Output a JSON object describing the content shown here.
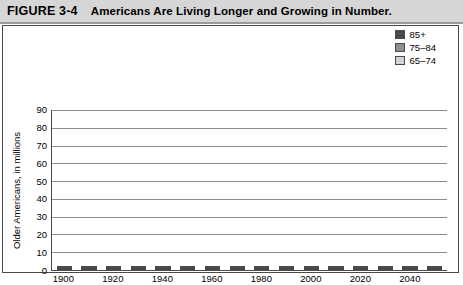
{
  "header": {
    "figure_number": "FIGURE 3-4",
    "title": "Americans Are Living Longer and Growing in Number."
  },
  "legend": {
    "position": "top-right",
    "items": [
      {
        "label": "85+",
        "color": "#494949",
        "key": "85+"
      },
      {
        "label": "75–84",
        "color": "#8f8f8f",
        "key": "75-84"
      },
      {
        "label": "65–74",
        "color": "#d2d2d2",
        "key": "65-74"
      }
    ]
  },
  "chart_data": {
    "type": "bar",
    "subtype": "stacked-vertical",
    "title": "Americans Are Living Longer and Growing in Number.",
    "xlabel": "",
    "ylabel": "Older Americans, in millions",
    "ylim": [
      0,
      90
    ],
    "ytick_step": 10,
    "yticks": [
      0,
      10,
      20,
      30,
      40,
      50,
      60,
      70,
      80,
      90
    ],
    "grid": "horizontal",
    "categories": [
      "1900",
      "1910",
      "1920",
      "1930",
      "1940",
      "1950",
      "1960",
      "1970",
      "1980",
      "1990",
      "2000",
      "2010",
      "2020",
      "2030",
      "2040",
      "2050"
    ],
    "xtick_labels": [
      "1900",
      "",
      "1920",
      "",
      "1940",
      "",
      "1960",
      "",
      "1980",
      "",
      "2000",
      "",
      "2020",
      "",
      "2040",
      ""
    ],
    "series": [
      {
        "name": "65–74",
        "color": "#d2d2d2",
        "values": [
          2.2,
          3.0,
          4.0,
          5.4,
          6.9,
          8.4,
          11.0,
          12.5,
          15.6,
          18.0,
          18.4,
          21.0,
          32.0,
          38.0,
          35.0,
          35.0
        ]
      },
      {
        "name": "75–84",
        "color": "#8f8f8f",
        "values": [
          0.8,
          1.0,
          1.3,
          1.8,
          2.5,
          3.3,
          4.6,
          6.1,
          7.7,
          10.0,
          12.4,
          13.0,
          15.5,
          25.0,
          30.0,
          30.0
        ]
      },
      {
        "name": "85+",
        "color": "#494949",
        "values": [
          0.2,
          0.3,
          0.4,
          0.5,
          0.8,
          0.6,
          0.9,
          1.4,
          2.2,
          3.0,
          4.2,
          5.8,
          6.5,
          8.0,
          13.5,
          18.0
        ]
      }
    ],
    "totals": [
      3.2,
      4.3,
      5.7,
      7.7,
      10.2,
      12.3,
      16.5,
      20.0,
      25.5,
      31.0,
      35.0,
      39.8,
      54.0,
      71.0,
      78.5,
      83.0
    ]
  }
}
